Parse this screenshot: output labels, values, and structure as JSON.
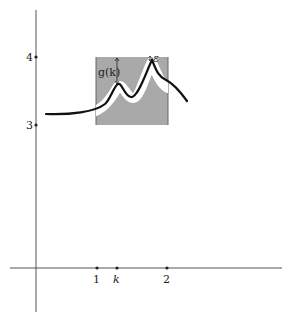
{
  "figure": {
    "y_axis": {
      "ticks": [
        {
          "label": "4",
          "y": 57
        },
        {
          "label": "3",
          "y": 125
        }
      ]
    },
    "x_axis": {
      "ticks": [
        {
          "label": "1",
          "x": 97
        },
        {
          "label": "k",
          "x": 117
        },
        {
          "label": "2",
          "x": 167
        }
      ]
    },
    "annotations": {
      "gap_label": "g(k)",
      "epsilon_label": "ε"
    },
    "colors": {
      "band_gray": "#a9a9a9",
      "band_white": "#ffffff",
      "curve": "#111111",
      "axis": "#555555"
    }
  }
}
